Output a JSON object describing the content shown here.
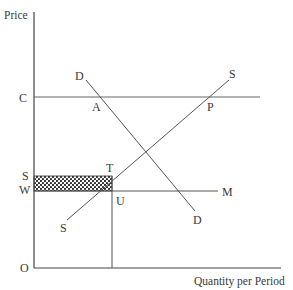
{
  "diagram": {
    "type": "supply-demand",
    "axes": {
      "y_label": "Price",
      "x_label": "Quantity per Period",
      "origin_label": "O"
    },
    "price_levels": {
      "C": "C",
      "S": "S",
      "W": "W"
    },
    "curves": {
      "demand_top_label": "D",
      "demand_bottom_label": "D",
      "supply_top_label": "S",
      "supply_bottom_label": "S",
      "world_price_line_label": "M"
    },
    "points": {
      "A": "A",
      "P": "P",
      "T": "T",
      "U": "U"
    },
    "shaded_region": {
      "description": "Rectangle between price levels S and W, from the price axis to quantity at T/U",
      "pattern": "dotted",
      "color": "#222222"
    },
    "colors": {
      "lines": "#555555",
      "axes": "#444444",
      "text": "#3a3a3a"
    }
  }
}
